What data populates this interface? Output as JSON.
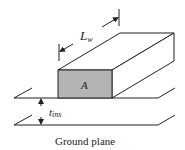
{
  "diagram": {
    "labels": {
      "length": "L",
      "length_sub": "w",
      "cross_section": "A",
      "insulation": "t",
      "insulation_sub": "ins",
      "ground": "Ground plane"
    },
    "colors": {
      "line": "#222222",
      "face_fill": "#b4b4b4",
      "background": "#ffffff"
    }
  }
}
